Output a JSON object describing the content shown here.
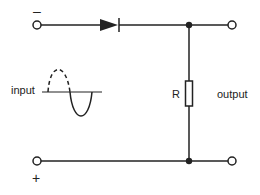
{
  "diagram": {
    "type": "half-wave rectifier circuit",
    "labels": {
      "input": "input",
      "output": "output",
      "resistor": "R",
      "top_polarity": "–",
      "bottom_polarity": "+"
    },
    "components": [
      {
        "name": "diode",
        "symbol": "diode-icon",
        "position": "top wire"
      },
      {
        "name": "resistor",
        "symbol": "resistor-icon",
        "label": "R",
        "position": "between top and bottom wires"
      }
    ],
    "terminals": [
      {
        "name": "input-top",
        "polarity": "–"
      },
      {
        "name": "input-bottom",
        "polarity": "+"
      },
      {
        "name": "output-top"
      },
      {
        "name": "output-bottom"
      }
    ],
    "waveform": {
      "description": "sine wave with dashed positive half-cycle and solid negative half-cycle",
      "positive_half": "dashed",
      "negative_half": "solid"
    },
    "colors": {
      "line": "#222222",
      "background": "#ffffff"
    }
  }
}
